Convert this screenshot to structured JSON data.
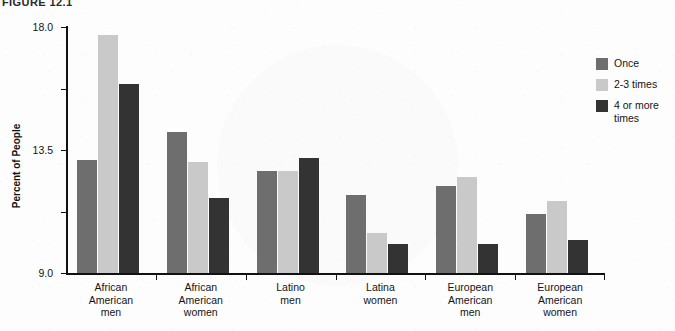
{
  "figure": {
    "caption": "FIGURE 12.1"
  },
  "chart_data": {
    "type": "bar",
    "title": "",
    "xlabel": "",
    "ylabel": "Percent of People",
    "ylim": [
      0,
      18.0
    ],
    "yticks": [
      "0",
      "4.5",
      "9.0",
      "13.5",
      "18.0"
    ],
    "ytick_values": [
      0,
      4.5,
      9.0,
      13.5,
      18.0
    ],
    "grid": false,
    "legend_position": "right",
    "categories": [
      "African American men",
      "African American women",
      "Latino men",
      "Latina women",
      "European American men",
      "European American women"
    ],
    "category_lines": [
      [
        "African",
        "American",
        "men"
      ],
      [
        "African",
        "American",
        "women"
      ],
      [
        "Latino",
        "men"
      ],
      [
        "Latina",
        "women"
      ],
      [
        "European",
        "American",
        "men"
      ],
      [
        "European",
        "American",
        "women"
      ]
    ],
    "series": [
      {
        "name": "Once",
        "color": "#6e6e6e",
        "values": [
          8.3,
          10.3,
          7.5,
          5.7,
          6.4,
          4.3
        ]
      },
      {
        "name": "2-3 times",
        "color": "#c9c9c9",
        "values": [
          17.4,
          8.1,
          7.5,
          2.9,
          7.0,
          5.3
        ]
      },
      {
        "name": "4 or more times",
        "color": "#333333",
        "values": [
          13.8,
          5.5,
          8.4,
          2.1,
          2.1,
          2.4
        ]
      }
    ],
    "legend_entries": [
      {
        "label": "Once",
        "color": "#6e6e6e"
      },
      {
        "label": "2-3 times",
        "color": "#c9c9c9"
      },
      {
        "label": "4 or more times",
        "color": "#333333"
      }
    ]
  }
}
